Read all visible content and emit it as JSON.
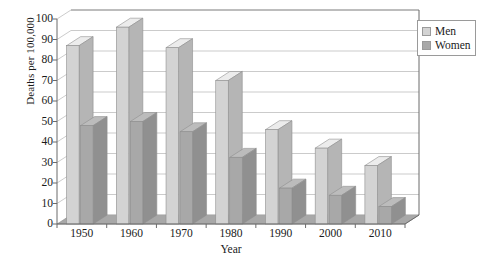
{
  "chart_data": {
    "type": "bar",
    "title": "",
    "subtitle": "",
    "xlabel": "Year",
    "ylabel": "Deaths per 100,000",
    "categories": [
      "1950",
      "1960",
      "1970",
      "1980",
      "1990",
      "2000",
      "2010"
    ],
    "series": [
      {
        "name": "Men",
        "color": "#d3d3d3",
        "values": [
          87,
          96,
          86,
          70,
          46,
          37,
          28.5
        ]
      },
      {
        "name": "Women",
        "color": "#a8a8a8",
        "values": [
          48,
          50,
          45,
          32.5,
          17.5,
          14,
          8.5
        ]
      }
    ],
    "ylim": [
      0,
      100
    ],
    "yticks": [
      0,
      10,
      20,
      30,
      40,
      50,
      60,
      70,
      80,
      90,
      100
    ],
    "ytick_labels": [
      "0",
      "10",
      "20",
      "30",
      "40",
      "50",
      "60",
      "70",
      "80",
      "90",
      "100"
    ],
    "grid": true,
    "grid_axis": "y",
    "legend_position": "right-top",
    "legend_entries": [
      "Men",
      "Women"
    ],
    "style": "3d-bars",
    "background_color": "#ffffff",
    "axis_color": "#6b6b6b",
    "grid_color": "#b5b5b5",
    "floor_color": "#a8a8a8"
  },
  "legend": {
    "entries": [
      {
        "label": "Men"
      },
      {
        "label": "Women"
      }
    ]
  },
  "axes": {
    "y_title": "Deaths per 100,000",
    "x_title": "Year"
  }
}
